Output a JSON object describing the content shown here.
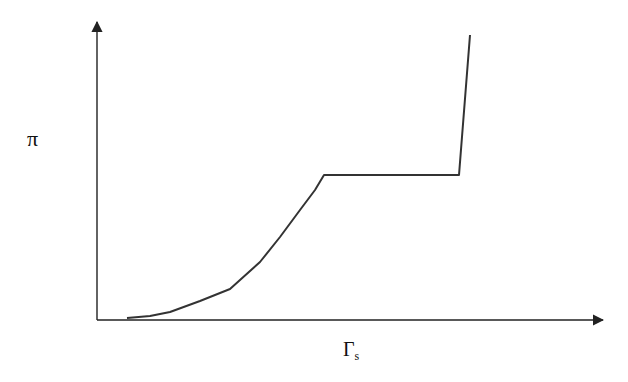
{
  "chart_data": {
    "type": "line",
    "title": "",
    "xlabel": "Γs",
    "xlabel_main": "Γ",
    "xlabel_sub": "s",
    "ylabel": "π",
    "grid": false,
    "legend": null,
    "ticks": {
      "x": [],
      "y": []
    },
    "x": [
      0.0,
      0.09,
      0.15,
      0.21,
      0.26,
      0.28,
      0.32,
      0.36,
      0.4,
      0.43,
      0.45,
      0.72,
      0.74
    ],
    "values": [
      0.0,
      0.02,
      0.06,
      0.1,
      0.15,
      0.2,
      0.28,
      0.37,
      0.44,
      0.5,
      0.51,
      0.51,
      1.0
    ],
    "segments": [
      {
        "name": "rising curve",
        "x_range": [
          0.0,
          0.45
        ]
      },
      {
        "name": "plateau",
        "x_range": [
          0.45,
          0.72
        ],
        "y": 0.51
      },
      {
        "name": "steep rise",
        "x_range": [
          0.72,
          0.74
        ]
      }
    ],
    "xlim": [
      0,
      1
    ],
    "ylim": [
      0,
      1.05
    ],
    "pixel_path": [
      [
        127,
        318
      ],
      [
        150,
        316
      ],
      [
        170,
        312
      ],
      [
        200,
        301
      ],
      [
        230,
        289
      ],
      [
        240,
        280
      ],
      [
        260,
        262
      ],
      [
        280,
        237
      ],
      [
        300,
        210
      ],
      [
        315,
        190
      ],
      [
        324,
        175
      ],
      [
        459,
        175
      ],
      [
        470,
        35
      ]
    ],
    "line_color": "#333333",
    "axis_color": "#222222"
  }
}
